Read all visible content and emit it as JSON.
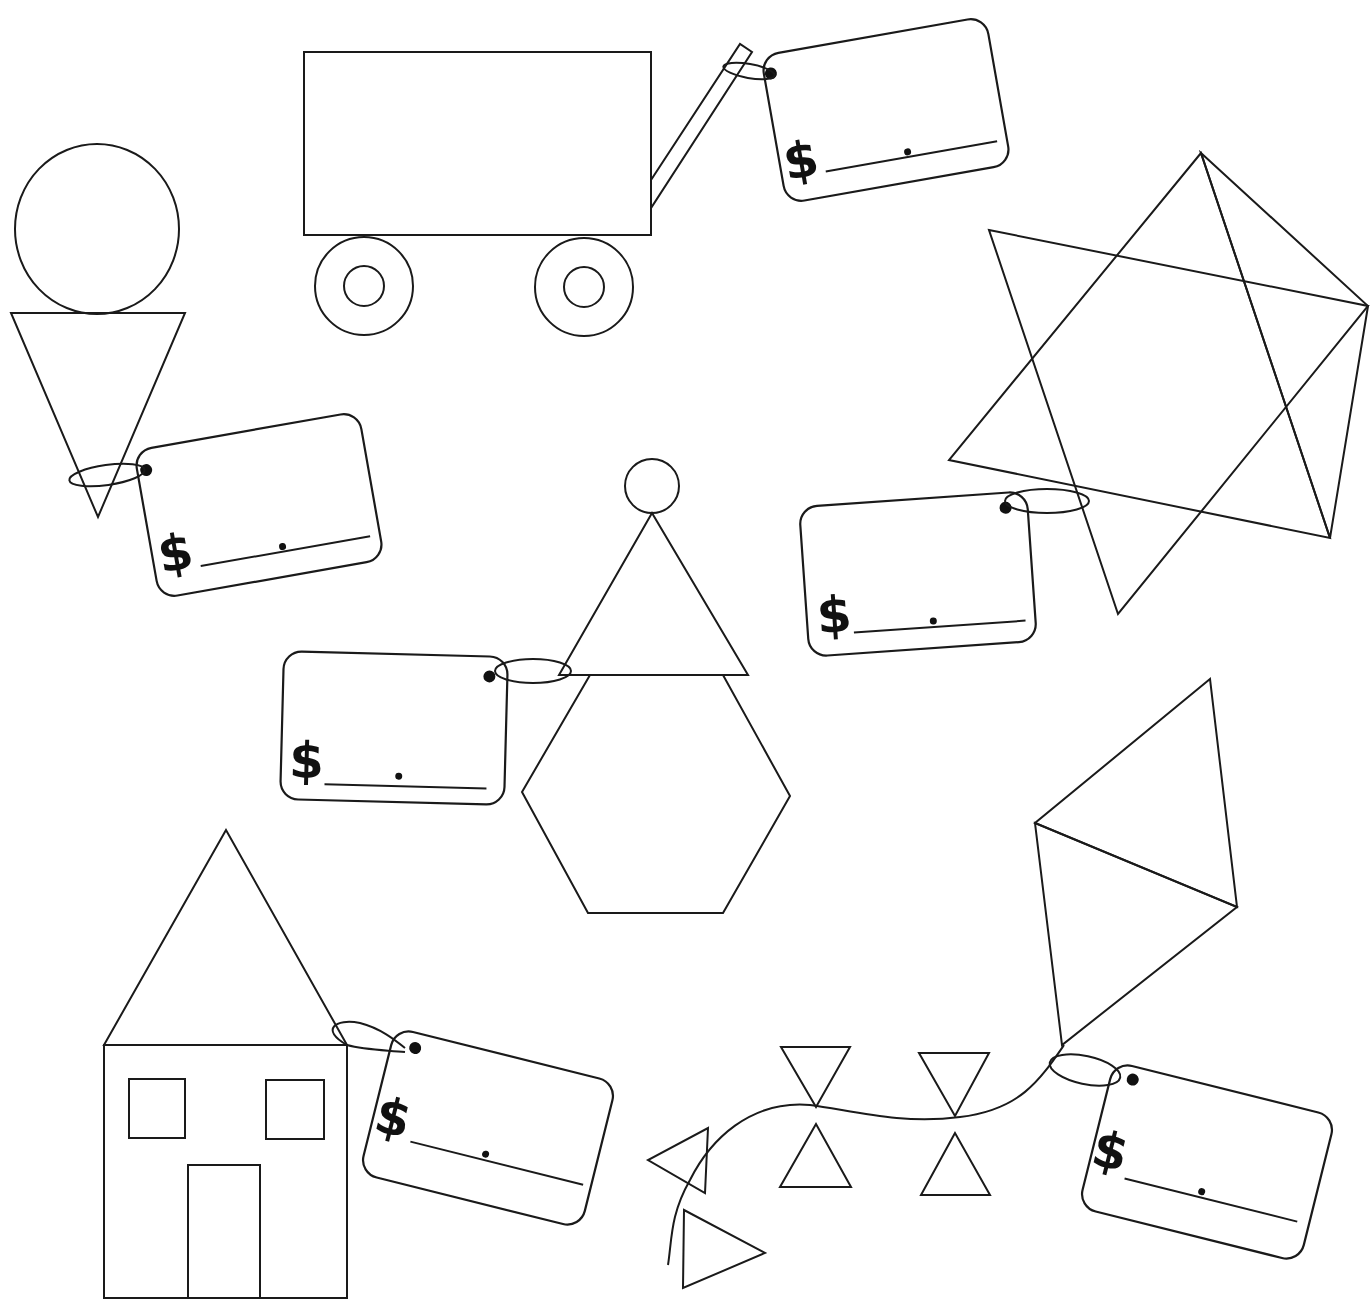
{
  "worksheet": {
    "colors": {
      "ink": "#1a1a1a",
      "paper": "#ffffff"
    },
    "figures": [
      {
        "id": "ice-cream-cone",
        "shapes": [
          "circle",
          "triangle"
        ]
      },
      {
        "id": "wagon",
        "shapes": [
          "rectangle",
          "circle",
          "circle",
          "circle",
          "circle",
          "handle"
        ]
      },
      {
        "id": "star",
        "shapes": [
          "triangle",
          "triangle"
        ]
      },
      {
        "id": "party-person",
        "shapes": [
          "circle",
          "triangle",
          "hexagon"
        ]
      },
      {
        "id": "house",
        "shapes": [
          "triangle",
          "rectangle",
          "square",
          "square",
          "rectangle"
        ]
      },
      {
        "id": "kite",
        "shapes": [
          "triangle",
          "triangle",
          "triangle",
          "triangle",
          "triangle",
          "triangle",
          "triangle",
          "triangle"
        ]
      }
    ],
    "price_tags": [
      {
        "figure": "wagon",
        "currency_symbol": "$",
        "decimal_point": ".",
        "value": ""
      },
      {
        "figure": "ice-cream-cone",
        "currency_symbol": "$",
        "decimal_point": ".",
        "value": ""
      },
      {
        "figure": "star",
        "currency_symbol": "$",
        "decimal_point": ".",
        "value": ""
      },
      {
        "figure": "party-person",
        "currency_symbol": "$",
        "decimal_point": ".",
        "value": ""
      },
      {
        "figure": "house",
        "currency_symbol": "$",
        "decimal_point": ".",
        "value": ""
      },
      {
        "figure": "kite",
        "currency_symbol": "$",
        "decimal_point": ".",
        "value": ""
      }
    ]
  }
}
